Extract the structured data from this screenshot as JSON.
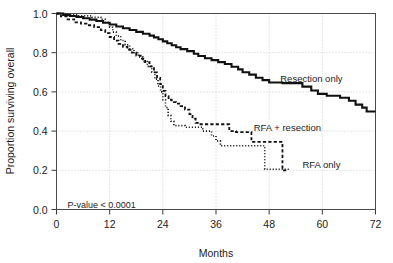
{
  "chart_data": {
    "type": "line",
    "title": "",
    "subtitle": "",
    "xlabel": "Months",
    "ylabel": "Proportion surviving overall",
    "xlim": [
      0,
      72
    ],
    "ylim": [
      0.0,
      1.0
    ],
    "xticks": [
      0,
      12,
      24,
      36,
      48,
      60,
      72
    ],
    "xtick_labels": [
      "0",
      "12",
      "24",
      "36",
      "48",
      "60",
      "72"
    ],
    "yticks": [
      0.0,
      0.2,
      0.4,
      0.6,
      0.8,
      1.0
    ],
    "ytick_labels": [
      "0.0",
      "0.2",
      "0.4",
      "0.6",
      "0.8",
      "1.0"
    ],
    "grid": true,
    "grid_style": "dotted",
    "legend_position": "inline-annotations",
    "annotations": [
      {
        "name": "p-value",
        "text": "P-value < 0.0001",
        "x": 2.5,
        "y": 0.025
      }
    ],
    "series": [
      {
        "name": "Resection only",
        "label": "Resection only",
        "line_style": "solid",
        "color": "#111111",
        "line_width": 2.1,
        "label_x": 50.5,
        "label_y": 0.665,
        "points": [
          [
            0,
            1.0
          ],
          [
            1.5,
            1.0
          ],
          [
            1.5,
            0.993
          ],
          [
            3,
            0.993
          ],
          [
            3,
            0.987
          ],
          [
            4.5,
            0.987
          ],
          [
            4.5,
            0.982
          ],
          [
            6,
            0.982
          ],
          [
            6,
            0.976
          ],
          [
            7.5,
            0.976
          ],
          [
            7.5,
            0.969
          ],
          [
            9,
            0.969
          ],
          [
            9,
            0.962
          ],
          [
            10.5,
            0.962
          ],
          [
            10.5,
            0.953
          ],
          [
            12,
            0.953
          ],
          [
            12,
            0.944
          ],
          [
            13.5,
            0.944
          ],
          [
            13.5,
            0.934
          ],
          [
            15,
            0.934
          ],
          [
            15,
            0.925
          ],
          [
            16.5,
            0.925
          ],
          [
            16.5,
            0.916
          ],
          [
            18,
            0.916
          ],
          [
            18,
            0.906
          ],
          [
            19.5,
            0.906
          ],
          [
            19.5,
            0.897
          ],
          [
            21,
            0.897
          ],
          [
            21,
            0.887
          ],
          [
            22,
            0.887
          ],
          [
            22,
            0.878
          ],
          [
            23,
            0.878
          ],
          [
            23,
            0.869
          ],
          [
            24,
            0.869
          ],
          [
            24,
            0.858
          ],
          [
            25,
            0.858
          ],
          [
            25,
            0.848
          ],
          [
            26,
            0.848
          ],
          [
            26,
            0.838
          ],
          [
            27,
            0.838
          ],
          [
            27,
            0.828
          ],
          [
            28,
            0.828
          ],
          [
            28,
            0.818
          ],
          [
            29.5,
            0.818
          ],
          [
            29.5,
            0.808
          ],
          [
            31,
            0.808
          ],
          [
            31,
            0.795
          ],
          [
            32,
            0.795
          ],
          [
            32,
            0.783
          ],
          [
            33.5,
            0.783
          ],
          [
            33.5,
            0.772
          ],
          [
            35,
            0.772
          ],
          [
            35,
            0.762
          ],
          [
            36.5,
            0.762
          ],
          [
            36.5,
            0.752
          ],
          [
            38,
            0.752
          ],
          [
            38,
            0.742
          ],
          [
            39.5,
            0.742
          ],
          [
            39.5,
            0.728
          ],
          [
            41,
            0.728
          ],
          [
            41,
            0.715
          ],
          [
            42,
            0.715
          ],
          [
            42,
            0.7
          ],
          [
            43.5,
            0.7
          ],
          [
            43.5,
            0.688
          ],
          [
            45,
            0.688
          ],
          [
            45,
            0.672
          ],
          [
            46.5,
            0.672
          ],
          [
            46.5,
            0.66
          ],
          [
            48,
            0.66
          ],
          [
            48,
            0.648
          ],
          [
            51,
            0.648
          ],
          [
            51,
            0.645
          ],
          [
            55.5,
            0.645
          ],
          [
            55.5,
            0.627
          ],
          [
            57.5,
            0.627
          ],
          [
            57.5,
            0.607
          ],
          [
            59,
            0.607
          ],
          [
            59,
            0.59
          ],
          [
            61,
            0.59
          ],
          [
            61,
            0.58
          ],
          [
            64,
            0.58
          ],
          [
            64,
            0.57
          ],
          [
            66,
            0.57
          ],
          [
            66,
            0.555
          ],
          [
            67.5,
            0.555
          ],
          [
            67.5,
            0.535
          ],
          [
            69,
            0.535
          ],
          [
            69,
            0.52
          ],
          [
            70,
            0.52
          ],
          [
            70,
            0.5
          ],
          [
            72,
            0.5
          ]
        ]
      },
      {
        "name": "RFA + resection",
        "label": "RFA + resection",
        "line_style": "dashed",
        "color": "#111111",
        "line_width": 1.8,
        "label_x": 44.5,
        "label_y": 0.415,
        "points": [
          [
            0,
            1.0
          ],
          [
            1,
            1.0
          ],
          [
            1,
            0.985
          ],
          [
            2.5,
            0.985
          ],
          [
            2.5,
            0.97
          ],
          [
            4,
            0.97
          ],
          [
            4,
            0.955
          ],
          [
            5.5,
            0.955
          ],
          [
            5.5,
            0.948
          ],
          [
            7,
            0.948
          ],
          [
            7,
            0.94
          ],
          [
            8.5,
            0.94
          ],
          [
            8.5,
            0.93
          ],
          [
            10,
            0.93
          ],
          [
            10,
            0.915
          ],
          [
            11,
            0.915
          ],
          [
            11,
            0.9
          ],
          [
            12,
            0.9
          ],
          [
            12,
            0.88
          ],
          [
            13,
            0.88
          ],
          [
            13,
            0.862
          ],
          [
            14,
            0.862
          ],
          [
            14,
            0.845
          ],
          [
            15,
            0.845
          ],
          [
            15,
            0.83
          ],
          [
            16,
            0.83
          ],
          [
            16,
            0.815
          ],
          [
            17,
            0.815
          ],
          [
            17,
            0.8
          ],
          [
            18,
            0.8
          ],
          [
            18,
            0.785
          ],
          [
            19,
            0.785
          ],
          [
            19,
            0.77
          ],
          [
            20,
            0.77
          ],
          [
            20,
            0.752
          ],
          [
            21,
            0.752
          ],
          [
            21,
            0.73
          ],
          [
            22,
            0.73
          ],
          [
            22,
            0.7
          ],
          [
            22.7,
            0.7
          ],
          [
            22.7,
            0.672
          ],
          [
            23.4,
            0.672
          ],
          [
            23.4,
            0.64
          ],
          [
            24,
            0.64
          ],
          [
            24,
            0.605
          ],
          [
            24.6,
            0.605
          ],
          [
            24.6,
            0.578
          ],
          [
            25.3,
            0.578
          ],
          [
            25.3,
            0.56
          ],
          [
            26,
            0.56
          ],
          [
            26,
            0.548
          ],
          [
            27,
            0.548
          ],
          [
            27,
            0.54
          ],
          [
            28,
            0.54
          ],
          [
            28,
            0.527
          ],
          [
            29,
            0.527
          ],
          [
            29,
            0.51
          ],
          [
            30,
            0.51
          ],
          [
            30,
            0.487
          ],
          [
            30.7,
            0.487
          ],
          [
            30.7,
            0.463
          ],
          [
            31.4,
            0.463
          ],
          [
            31.4,
            0.442
          ],
          [
            32.5,
            0.442
          ],
          [
            32.5,
            0.435
          ],
          [
            39,
            0.435
          ],
          [
            39,
            0.4
          ],
          [
            40.5,
            0.4
          ],
          [
            40.5,
            0.395
          ],
          [
            44,
            0.395
          ],
          [
            44,
            0.345
          ],
          [
            51,
            0.345
          ],
          [
            51,
            0.2
          ],
          [
            52.3,
            0.2
          ]
        ]
      },
      {
        "name": "RFA only",
        "label": "RFA  only",
        "line_style": "dotted",
        "color": "#7a7a7a",
        "line_width": 1.6,
        "label_x": 55.5,
        "label_y": 0.225,
        "points": [
          [
            0,
            1.0
          ],
          [
            2,
            1.0
          ],
          [
            2,
            0.993
          ],
          [
            5,
            0.993
          ],
          [
            5,
            0.988
          ],
          [
            8,
            0.988
          ],
          [
            8,
            0.98
          ],
          [
            10,
            0.98
          ],
          [
            10,
            0.97
          ],
          [
            11,
            0.97
          ],
          [
            11,
            0.955
          ],
          [
            12,
            0.955
          ],
          [
            12,
            0.93
          ],
          [
            12.7,
            0.93
          ],
          [
            12.7,
            0.905
          ],
          [
            13.5,
            0.905
          ],
          [
            13.5,
            0.885
          ],
          [
            14.5,
            0.885
          ],
          [
            14.5,
            0.862
          ],
          [
            15.5,
            0.862
          ],
          [
            15.5,
            0.84
          ],
          [
            16.5,
            0.84
          ],
          [
            16.5,
            0.82
          ],
          [
            17.5,
            0.82
          ],
          [
            17.5,
            0.8
          ],
          [
            18.5,
            0.8
          ],
          [
            18.5,
            0.778
          ],
          [
            19.5,
            0.778
          ],
          [
            19.5,
            0.755
          ],
          [
            20.5,
            0.755
          ],
          [
            20.5,
            0.73
          ],
          [
            21.5,
            0.73
          ],
          [
            21.5,
            0.7
          ],
          [
            22.2,
            0.7
          ],
          [
            22.2,
            0.665
          ],
          [
            22.9,
            0.665
          ],
          [
            22.9,
            0.63
          ],
          [
            23.5,
            0.63
          ],
          [
            23.5,
            0.6
          ],
          [
            24,
            0.6
          ],
          [
            24,
            0.56
          ],
          [
            24.6,
            0.56
          ],
          [
            24.6,
            0.52
          ],
          [
            25.2,
            0.52
          ],
          [
            25.2,
            0.48
          ],
          [
            25.8,
            0.48
          ],
          [
            25.8,
            0.45
          ],
          [
            26.5,
            0.45
          ],
          [
            26.5,
            0.428
          ],
          [
            29,
            0.428
          ],
          [
            29,
            0.42
          ],
          [
            33,
            0.42
          ],
          [
            33,
            0.4
          ],
          [
            35,
            0.4
          ],
          [
            35,
            0.375
          ],
          [
            36,
            0.375
          ],
          [
            36,
            0.35
          ],
          [
            37,
            0.35
          ],
          [
            37,
            0.325
          ],
          [
            47,
            0.325
          ],
          [
            47,
            0.205
          ],
          [
            52.5,
            0.205
          ]
        ]
      }
    ]
  },
  "axes": {
    "x_title": "Months",
    "y_title": "Proportion surviving overall"
  }
}
